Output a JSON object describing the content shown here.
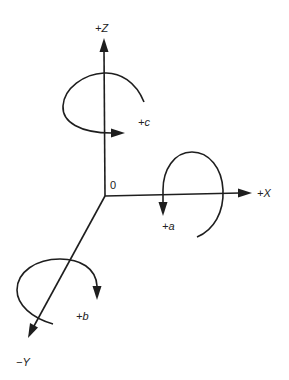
{
  "diagram": {
    "title": "",
    "origin_label": "0",
    "axes": [
      {
        "id": "z",
        "label": "+Z",
        "direction": "up"
      },
      {
        "id": "x",
        "label": "+X",
        "direction": "right"
      },
      {
        "id": "y",
        "label": "−Y",
        "direction": "down-left"
      }
    ],
    "rotations": [
      {
        "id": "c",
        "label": "+c",
        "about_axis": "Z"
      },
      {
        "id": "a",
        "label": "+a",
        "about_axis": "X"
      },
      {
        "id": "b",
        "label": "+b",
        "about_axis": "Y"
      }
    ],
    "colors": {
      "stroke": "#1e1e1e",
      "background": "#ffffff"
    }
  }
}
